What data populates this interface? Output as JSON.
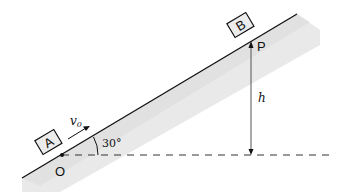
{
  "diagram": {
    "type": "physics-incline",
    "incline_angle_label": "30°",
    "block_a_label": "A",
    "block_b_label": "B",
    "origin_label": "O",
    "point_p_label": "P",
    "height_label": "h",
    "velocity_label": "v",
    "velocity_subscript": "0",
    "colors": {
      "line": "#111111",
      "shading": "#e6e6e6",
      "block_fill": "#e8e8e8",
      "dashed": "#333333",
      "height_arrow": "#555555"
    }
  }
}
